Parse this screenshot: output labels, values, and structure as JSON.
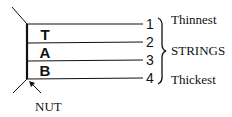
{
  "diagram": {
    "tab_letters": [
      "T",
      "A",
      "B"
    ],
    "strings": [
      {
        "number": "1"
      },
      {
        "number": "2"
      },
      {
        "number": "3"
      },
      {
        "number": "4"
      }
    ],
    "labels": {
      "thinnest": "Thinnest",
      "strings": "STRINGS",
      "thickest": "Thickest",
      "nut": "NUT"
    },
    "colors": {
      "ink": "#111111",
      "background": "#ffffff"
    }
  }
}
